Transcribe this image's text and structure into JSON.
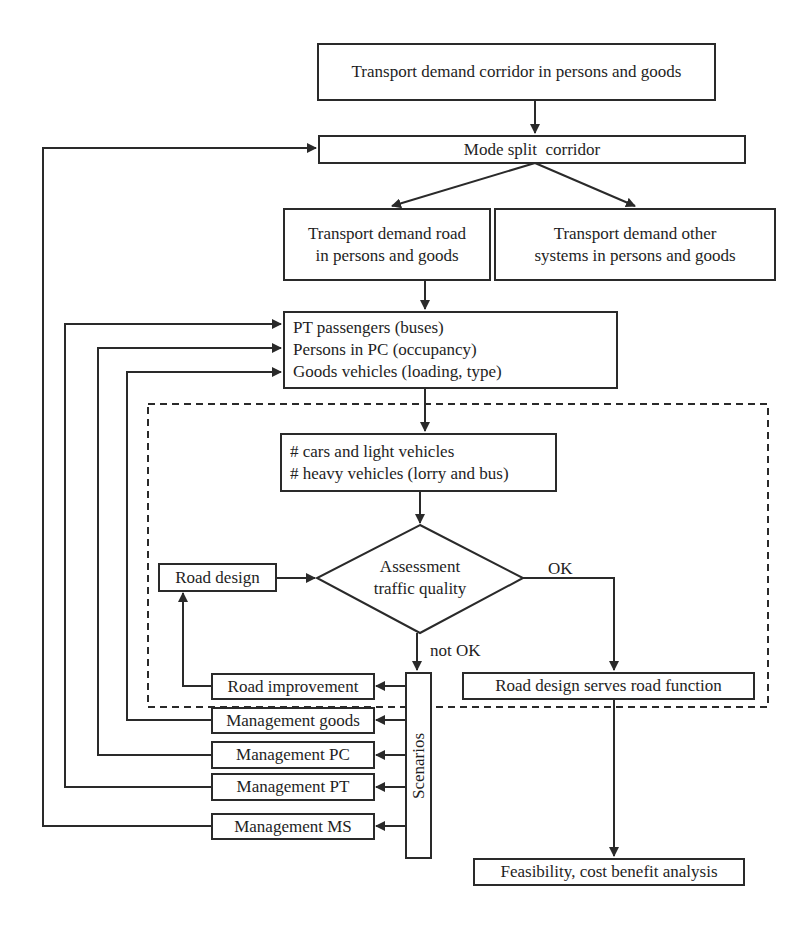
{
  "diagram": {
    "nodes": {
      "demand_corridor": "Transport demand corridor in persons and goods",
      "mode_split": "Mode split  corridor",
      "demand_road": [
        "Transport demand road",
        "in persons and goods"
      ],
      "demand_other": [
        "Transport demand other",
        "systems in persons and goods"
      ],
      "occupancy": [
        "PT passengers (buses)",
        "Persons in PC (occupancy)",
        "Goods vehicles (loading, type)"
      ],
      "vehicles": [
        "# cars and light vehicles",
        "# heavy vehicles (lorry and bus)"
      ],
      "assessment": [
        "Assessment",
        "traffic quality"
      ],
      "road_design": "Road design",
      "road_function": "Road design serves road function",
      "feasibility": "Feasibility, cost benefit analysis",
      "scenarios": "Scenarios",
      "scenario_items": [
        "Road improvement",
        "Management goods",
        "Management PC",
        "Management PT",
        "Management MS"
      ]
    },
    "edge_labels": {
      "ok": "OK",
      "not_ok": "not OK"
    },
    "colors": {
      "line": "#2a2a2a",
      "background": "#ffffff"
    }
  }
}
